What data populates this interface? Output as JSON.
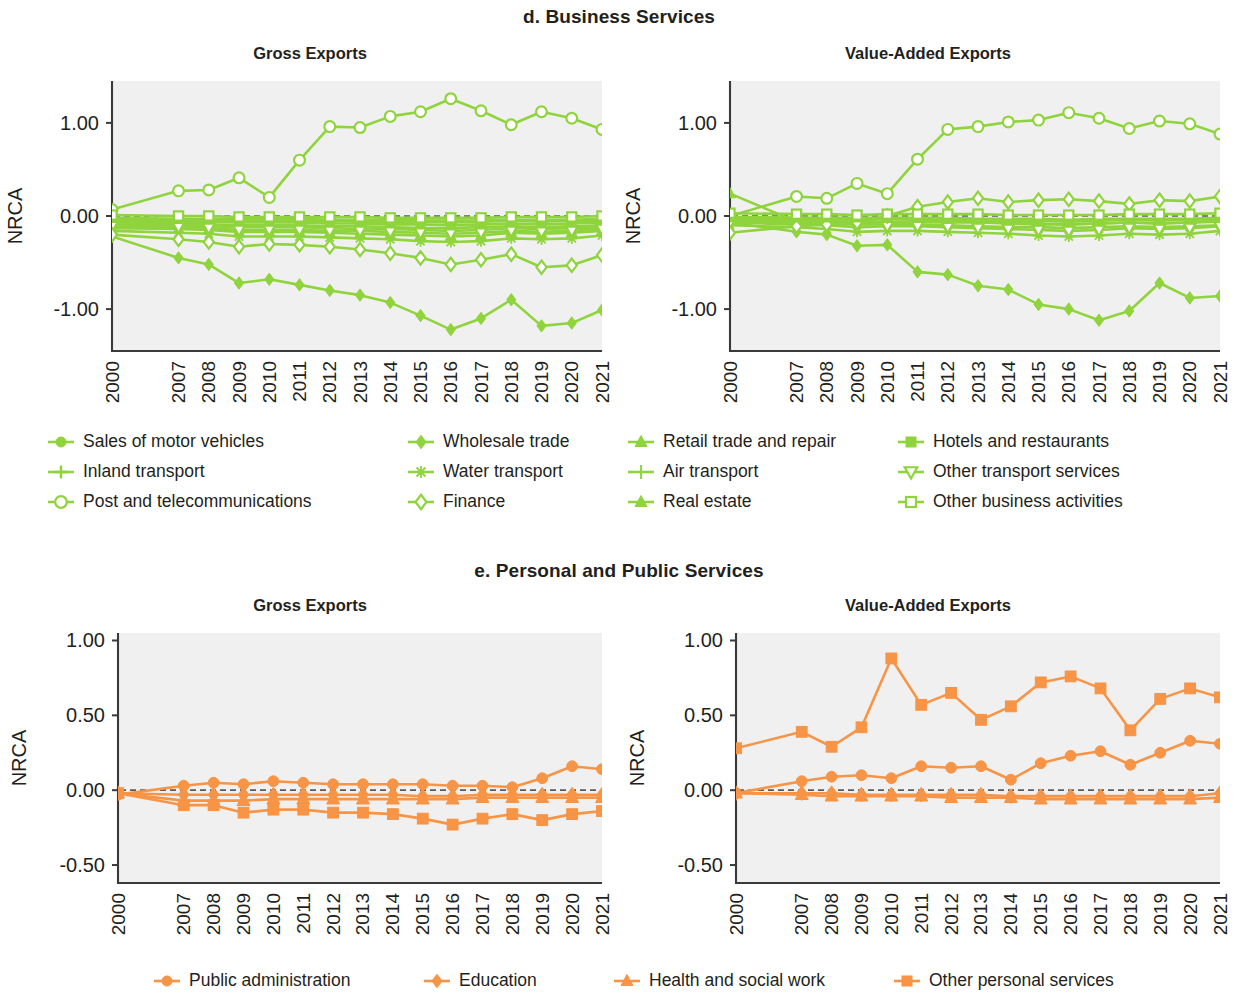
{
  "colors": {
    "green": "#8FD43C",
    "orange": "#F79445",
    "plot_bg": "#F0F0F0",
    "axis": "#3A3A3A",
    "text": "#231F20"
  },
  "panels": [
    {
      "id": "d",
      "title": "d. Business Services"
    },
    {
      "id": "e",
      "title": "e. Personal and Public Services"
    }
  ],
  "chart_titles": {
    "gross": "Gross Exports",
    "value_added": "Value-Added Exports"
  },
  "axis": {
    "ylabel": "NRCA"
  },
  "legends": {
    "business": [
      {
        "label": "Sales of motor vehicles",
        "marker": "circle-filled"
      },
      {
        "label": "Wholesale trade",
        "marker": "diamond-filled"
      },
      {
        "label": "Retail trade and repair",
        "marker": "triangle-filled"
      },
      {
        "label": "Hotels and restaurants",
        "marker": "square-filled"
      },
      {
        "label": "Inland transport",
        "marker": "plus"
      },
      {
        "label": "Water transport",
        "marker": "star"
      },
      {
        "label": "Air transport",
        "marker": "plus-thin"
      },
      {
        "label": "Other transport services",
        "marker": "triangle-down-open"
      },
      {
        "label": "Post and telecommunications",
        "marker": "circle-open"
      },
      {
        "label": "Finance",
        "marker": "diamond-open"
      },
      {
        "label": "Real estate",
        "marker": "triangle-filled"
      },
      {
        "label": "Other business activities",
        "marker": "square-open"
      }
    ],
    "personal": [
      {
        "label": "Public administration",
        "marker": "circle-filled"
      },
      {
        "label": "Education",
        "marker": "diamond-filled"
      },
      {
        "label": "Health and social work",
        "marker": "triangle-filled"
      },
      {
        "label": "Other personal services",
        "marker": "square-filled"
      }
    ]
  },
  "chart_data": [
    {
      "id": "business-gross",
      "type": "line",
      "title": "Gross Exports",
      "panel": "d. Business Services",
      "xlabel": "",
      "ylabel": "NRCA",
      "x": [
        "2000",
        "2007",
        "2008",
        "2009",
        "2010",
        "2011",
        "2012",
        "2013",
        "2014",
        "2015",
        "2016",
        "2017",
        "2018",
        "2019",
        "2020",
        "2021"
      ],
      "yticks": [
        1.0,
        0.0,
        -1.0
      ],
      "ytick_labels": [
        "1.00",
        "0.00",
        "-1.00"
      ],
      "ylim": [
        -1.45,
        1.45
      ],
      "grid": false,
      "color": "#8FD43C",
      "series": [
        {
          "name": "Sales of motor vehicles",
          "marker": "circle-filled",
          "values": [
            -0.09,
            -0.1,
            -0.11,
            -0.12,
            -0.12,
            -0.12,
            -0.13,
            -0.14,
            -0.14,
            -0.15,
            -0.16,
            -0.15,
            -0.13,
            -0.14,
            -0.13,
            -0.12
          ]
        },
        {
          "name": "Wholesale trade",
          "marker": "diamond-filled",
          "values": [
            -0.22,
            -0.45,
            -0.52,
            -0.72,
            -0.68,
            -0.74,
            -0.8,
            -0.85,
            -0.93,
            -1.07,
            -1.22,
            -1.1,
            -0.9,
            -1.18,
            -1.15,
            -1.01
          ]
        },
        {
          "name": "Retail trade and repair",
          "marker": "triangle-filled",
          "values": [
            -0.13,
            -0.14,
            -0.15,
            -0.17,
            -0.17,
            -0.17,
            -0.18,
            -0.19,
            -0.2,
            -0.21,
            -0.22,
            -0.21,
            -0.18,
            -0.19,
            -0.18,
            -0.16
          ]
        },
        {
          "name": "Hotels and restaurants",
          "marker": "square-filled",
          "values": [
            -0.05,
            -0.06,
            -0.06,
            -0.07,
            -0.07,
            -0.07,
            -0.08,
            -0.08,
            -0.09,
            -0.09,
            -0.1,
            -0.09,
            -0.08,
            -0.09,
            -0.08,
            -0.07
          ]
        },
        {
          "name": "Inland transport",
          "marker": "plus",
          "values": [
            -0.07,
            -0.08,
            -0.09,
            -0.1,
            -0.1,
            -0.1,
            -0.11,
            -0.11,
            -0.12,
            -0.13,
            -0.13,
            -0.12,
            -0.11,
            -0.12,
            -0.11,
            -0.1
          ]
        },
        {
          "name": "Water transport",
          "marker": "star",
          "values": [
            -0.16,
            -0.18,
            -0.19,
            -0.22,
            -0.22,
            -0.22,
            -0.23,
            -0.24,
            -0.25,
            -0.27,
            -0.28,
            -0.27,
            -0.24,
            -0.25,
            -0.24,
            -0.21
          ]
        },
        {
          "name": "Air transport",
          "marker": "plus-thin",
          "values": [
            -0.03,
            -0.04,
            -0.04,
            -0.05,
            -0.05,
            -0.05,
            -0.05,
            -0.06,
            -0.06,
            -0.06,
            -0.07,
            -0.06,
            -0.05,
            -0.06,
            -0.05,
            -0.05
          ]
        },
        {
          "name": "Other transport services",
          "marker": "triangle-down-open",
          "values": [
            -0.11,
            -0.12,
            -0.13,
            -0.15,
            -0.15,
            -0.15,
            -0.16,
            -0.16,
            -0.17,
            -0.18,
            -0.19,
            -0.18,
            -0.16,
            -0.17,
            -0.16,
            -0.14
          ]
        },
        {
          "name": "Post and telecommunications",
          "marker": "circle-open",
          "values": [
            0.07,
            0.27,
            0.28,
            0.41,
            0.2,
            0.6,
            0.96,
            0.95,
            1.07,
            1.12,
            1.26,
            1.13,
            0.98,
            1.12,
            1.05,
            0.93
          ]
        },
        {
          "name": "Finance",
          "marker": "diamond-open",
          "values": [
            -0.2,
            -0.25,
            -0.28,
            -0.33,
            -0.3,
            -0.31,
            -0.33,
            -0.36,
            -0.4,
            -0.45,
            -0.52,
            -0.47,
            -0.41,
            -0.55,
            -0.53,
            -0.42
          ]
        },
        {
          "name": "Real estate",
          "marker": "triangle-filled",
          "values": [
            -0.02,
            -0.03,
            -0.03,
            -0.03,
            -0.03,
            -0.03,
            -0.04,
            -0.04,
            -0.04,
            -0.05,
            -0.05,
            -0.05,
            -0.04,
            -0.04,
            -0.04,
            -0.03
          ]
        },
        {
          "name": "Other business activities",
          "marker": "square-open",
          "values": [
            0.01,
            0.0,
            0.0,
            -0.01,
            -0.01,
            -0.01,
            -0.01,
            -0.01,
            -0.02,
            -0.02,
            -0.02,
            -0.02,
            -0.01,
            -0.01,
            -0.01,
            0.0
          ]
        }
      ]
    },
    {
      "id": "business-value-added",
      "type": "line",
      "title": "Value-Added Exports",
      "panel": "d. Business Services",
      "xlabel": "",
      "ylabel": "NRCA",
      "x": [
        "2000",
        "2007",
        "2008",
        "2009",
        "2010",
        "2011",
        "2012",
        "2013",
        "2014",
        "2015",
        "2016",
        "2017",
        "2018",
        "2019",
        "2020",
        "2021"
      ],
      "yticks": [
        1.0,
        0.0,
        -1.0
      ],
      "ytick_labels": [
        "1.00",
        "0.00",
        "-1.00"
      ],
      "ylim": [
        -1.45,
        1.45
      ],
      "grid": false,
      "color": "#8FD43C",
      "series": [
        {
          "name": "Sales of motor vehicles",
          "marker": "circle-filled",
          "values": [
            -0.05,
            -0.07,
            -0.08,
            -0.09,
            -0.09,
            -0.09,
            -0.1,
            -0.11,
            -0.12,
            -0.12,
            -0.13,
            -0.12,
            -0.11,
            -0.12,
            -0.11,
            -0.1
          ]
        },
        {
          "name": "Wholesale trade",
          "marker": "diamond-filled",
          "values": [
            -0.07,
            -0.17,
            -0.2,
            -0.32,
            -0.31,
            -0.6,
            -0.63,
            -0.75,
            -0.79,
            -0.95,
            -1.0,
            -1.12,
            -1.02,
            -0.72,
            -0.88,
            -0.86,
            -0.76
          ]
        },
        {
          "name": "Retail trade and repair",
          "marker": "triangle-filled",
          "values": [
            0.24,
            -0.06,
            -0.04,
            -0.05,
            -0.03,
            -0.04,
            -0.05,
            -0.06,
            -0.07,
            -0.08,
            -0.09,
            -0.08,
            -0.07,
            -0.08,
            -0.07,
            -0.05
          ]
        },
        {
          "name": "Hotels and restaurants",
          "marker": "square-filled",
          "values": [
            -0.02,
            -0.03,
            -0.03,
            -0.04,
            -0.03,
            -0.03,
            -0.04,
            -0.04,
            -0.05,
            -0.05,
            -0.06,
            -0.05,
            -0.04,
            -0.05,
            -0.04,
            -0.03
          ]
        },
        {
          "name": "Inland transport",
          "marker": "plus",
          "values": [
            -0.04,
            -0.05,
            -0.06,
            -0.07,
            -0.06,
            -0.06,
            -0.07,
            -0.07,
            -0.08,
            -0.09,
            -0.09,
            -0.08,
            -0.07,
            -0.08,
            -0.07,
            -0.06
          ]
        },
        {
          "name": "Water transport",
          "marker": "star",
          "values": [
            -0.1,
            -0.12,
            -0.14,
            -0.17,
            -0.16,
            -0.16,
            -0.17,
            -0.18,
            -0.19,
            -0.21,
            -0.22,
            -0.21,
            -0.19,
            -0.2,
            -0.19,
            -0.16
          ]
        },
        {
          "name": "Air transport",
          "marker": "plus-thin",
          "values": [
            -0.02,
            -0.02,
            -0.03,
            -0.03,
            -0.03,
            -0.03,
            -0.03,
            -0.04,
            -0.04,
            -0.04,
            -0.05,
            -0.04,
            -0.04,
            -0.04,
            -0.04,
            -0.03
          ]
        },
        {
          "name": "Other transport services",
          "marker": "triangle-down-open",
          "values": [
            -0.07,
            -0.09,
            -0.1,
            -0.12,
            -0.11,
            -0.11,
            -0.12,
            -0.13,
            -0.14,
            -0.15,
            -0.16,
            -0.15,
            -0.13,
            -0.14,
            -0.13,
            -0.11
          ]
        },
        {
          "name": "Post and telecommunications",
          "marker": "circle-open",
          "values": [
            0.0,
            0.21,
            0.19,
            0.35,
            0.24,
            0.61,
            0.93,
            0.96,
            1.01,
            1.03,
            1.11,
            1.05,
            0.94,
            1.02,
            0.99,
            0.88
          ]
        },
        {
          "name": "Finance",
          "marker": "diamond-open",
          "values": [
            -0.18,
            -0.11,
            -0.09,
            -0.07,
            0.0,
            0.1,
            0.15,
            0.19,
            0.15,
            0.17,
            0.18,
            0.16,
            0.13,
            0.17,
            0.16,
            0.21
          ]
        },
        {
          "name": "Real estate",
          "marker": "triangle-filled",
          "values": [
            -0.01,
            -0.02,
            -0.02,
            -0.02,
            -0.02,
            -0.02,
            -0.02,
            -0.03,
            -0.03,
            -0.03,
            -0.04,
            -0.03,
            -0.03,
            -0.03,
            -0.03,
            -0.02
          ]
        },
        {
          "name": "Other business activities",
          "marker": "square-open",
          "values": [
            0.03,
            0.02,
            0.02,
            0.01,
            0.02,
            0.02,
            0.02,
            0.02,
            0.01,
            0.01,
            0.01,
            0.01,
            0.02,
            0.02,
            0.02,
            0.03
          ]
        }
      ]
    },
    {
      "id": "personal-gross",
      "type": "line",
      "title": "Gross Exports",
      "panel": "e. Personal and Public Services",
      "xlabel": "",
      "ylabel": "NRCA",
      "x": [
        "2000",
        "2007",
        "2008",
        "2009",
        "2010",
        "2011",
        "2012",
        "2013",
        "2014",
        "2015",
        "2016",
        "2017",
        "2018",
        "2019",
        "2020",
        "2021"
      ],
      "yticks": [
        1.0,
        0.5,
        0.0,
        -0.5
      ],
      "ytick_labels": [
        "1.00",
        "0.50",
        "0.00",
        "-0.50"
      ],
      "ylim": [
        -0.62,
        1.05
      ],
      "grid": false,
      "color": "#F79445",
      "series": [
        {
          "name": "Public administration",
          "marker": "circle-filled",
          "values": [
            -0.03,
            0.03,
            0.05,
            0.04,
            0.06,
            0.05,
            0.04,
            0.04,
            0.04,
            0.04,
            0.03,
            0.03,
            0.02,
            0.08,
            0.16,
            0.14
          ]
        },
        {
          "name": "Education",
          "marker": "diamond-filled",
          "values": [
            -0.02,
            -0.03,
            -0.03,
            -0.03,
            -0.03,
            -0.03,
            -0.03,
            -0.03,
            -0.03,
            -0.04,
            -0.04,
            -0.03,
            -0.03,
            -0.03,
            -0.03,
            -0.03
          ]
        },
        {
          "name": "Health and social work",
          "marker": "triangle-filled",
          "values": [
            -0.02,
            -0.07,
            -0.07,
            -0.07,
            -0.06,
            -0.06,
            -0.06,
            -0.06,
            -0.06,
            -0.06,
            -0.06,
            -0.05,
            -0.05,
            -0.05,
            -0.05,
            -0.05
          ]
        },
        {
          "name": "Other personal services",
          "marker": "square-filled",
          "values": [
            -0.02,
            -0.1,
            -0.1,
            -0.15,
            -0.13,
            -0.13,
            -0.15,
            -0.15,
            -0.16,
            -0.19,
            -0.23,
            -0.19,
            -0.16,
            -0.2,
            -0.16,
            -0.14
          ]
        }
      ]
    },
    {
      "id": "personal-value-added",
      "type": "line",
      "title": "Value-Added Exports",
      "panel": "e. Personal and Public Services",
      "xlabel": "",
      "ylabel": "NRCA",
      "x": [
        "2000",
        "2007",
        "2008",
        "2009",
        "2010",
        "2011",
        "2012",
        "2013",
        "2014",
        "2015",
        "2016",
        "2017",
        "2018",
        "2019",
        "2020",
        "2021"
      ],
      "yticks": [
        1.0,
        0.5,
        0.0,
        -0.5
      ],
      "ytick_labels": [
        "1.00",
        "0.50",
        "0.00",
        "-0.50"
      ],
      "ylim": [
        -0.62,
        1.05
      ],
      "grid": false,
      "color": "#F79445",
      "series": [
        {
          "name": "Public administration",
          "marker": "circle-filled",
          "values": [
            -0.02,
            0.06,
            0.09,
            0.1,
            0.08,
            0.16,
            0.15,
            0.16,
            0.07,
            0.18,
            0.23,
            0.26,
            0.17,
            0.25,
            0.33,
            0.31
          ]
        },
        {
          "name": "Education",
          "marker": "diamond-filled",
          "values": [
            -0.02,
            -0.02,
            -0.02,
            -0.03,
            -0.03,
            -0.03,
            -0.03,
            -0.03,
            -0.04,
            -0.04,
            -0.04,
            -0.04,
            -0.04,
            -0.04,
            -0.04,
            -0.02
          ]
        },
        {
          "name": "Health and social work",
          "marker": "triangle-filled",
          "values": [
            -0.02,
            -0.03,
            -0.04,
            -0.04,
            -0.04,
            -0.04,
            -0.05,
            -0.05,
            -0.05,
            -0.06,
            -0.06,
            -0.06,
            -0.06,
            -0.06,
            -0.06,
            -0.05
          ]
        },
        {
          "name": "Other personal services",
          "marker": "square-filled",
          "values": [
            0.28,
            0.39,
            0.29,
            0.42,
            0.88,
            0.57,
            0.65,
            0.47,
            0.56,
            0.72,
            0.76,
            0.68,
            0.4,
            0.61,
            0.68,
            0.62
          ]
        }
      ]
    }
  ]
}
